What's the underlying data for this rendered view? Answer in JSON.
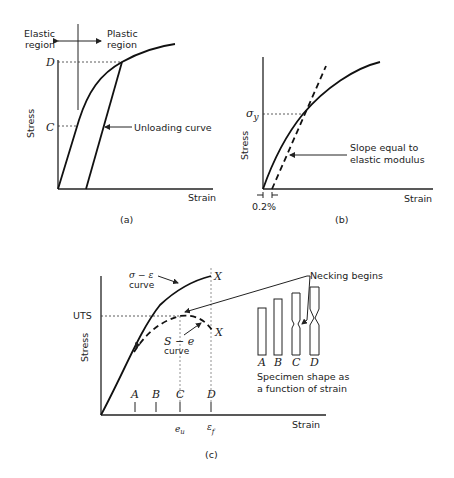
{
  "figure_a": {
    "caption": "(a)",
    "elastic_label_line1": "Elastic",
    "elastic_label_line2": "region",
    "plastic_label_line1": "Plastic",
    "plastic_label_line2": "region",
    "y_label": "Stress",
    "x_label": "Strain",
    "point_D": "D",
    "point_C": "C",
    "unloading_label": "Unloading curve"
  },
  "figure_b": {
    "caption": "(b)",
    "y_label": "Stress",
    "x_label": "Strain",
    "sigma_y": "σ",
    "sigma_y_sub": "y",
    "slope_label_line1": "Slope equal to",
    "slope_label_line2": "elastic modulus",
    "offset_label": "0.2%"
  },
  "figure_c": {
    "caption": "(c)",
    "y_label": "Stress",
    "x_label": "Strain",
    "uts_label": "UTS",
    "true_curve_label_line1": "σ − ε",
    "true_curve_label_line2": "curve",
    "eng_curve_label_line1": "S − e",
    "eng_curve_label_line2": "curve",
    "fracture_mark": "X",
    "necking_label": "Necking begins",
    "tick_labels": [
      "A",
      "B",
      "C",
      "D"
    ],
    "eu_label": "e",
    "eu_sub": "u",
    "ef_label": "ε",
    "ef_sub": "f",
    "specimen_labels": [
      "A",
      "B",
      "C",
      "D"
    ],
    "specimen_caption_line1": "Specimen shape as",
    "specimen_caption_line2": "a function of strain"
  }
}
